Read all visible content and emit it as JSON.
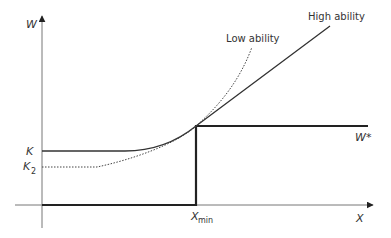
{
  "diagram": {
    "axes": {
      "y_label": "W",
      "x_label": "X"
    },
    "levels": {
      "k_label": "K",
      "k2_label": "K",
      "k2_subscript": "2",
      "w_star_label": "W*"
    },
    "threshold": {
      "x_label": "X",
      "x_subscript": "min"
    },
    "curves": {
      "high_ability_label": "High ability",
      "low_ability_label": "Low ability"
    },
    "colors": {
      "axis": "#555555",
      "curve": "#333333",
      "wage_step": "#222222"
    }
  }
}
